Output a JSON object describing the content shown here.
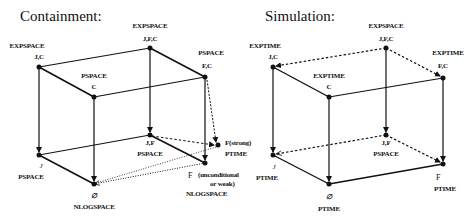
{
  "diagrams": [
    {
      "title": "Containment:",
      "nodes": {
        "jc": {
          "set": "J,C",
          "class": "EXPSPACE"
        },
        "jfc": {
          "set": "J,F,C",
          "class": "EXPSPACE"
        },
        "c": {
          "set": "C",
          "class": "PSPACE"
        },
        "fc": {
          "set": "F,C",
          "class": "PSPACE"
        },
        "j": {
          "set": "J",
          "class": "PSPACE"
        },
        "jf": {
          "set": "J,F",
          "class": "PSPACE"
        },
        "empty": {
          "set": "∅",
          "class": "NLOGSPACE"
        },
        "f": {
          "set": "F",
          "note1": "(unconditional",
          "note2": "or weak)",
          "class": "NLOGSPACE"
        },
        "fstrong": {
          "set": "F(strong)",
          "class": "PTIME"
        }
      }
    },
    {
      "title": "Simulation:",
      "nodes": {
        "jc": {
          "set": "J,C",
          "class": "EXPTIME"
        },
        "jfc": {
          "set": "J,F,C",
          "class": "EXPSPACE"
        },
        "c": {
          "set": "C",
          "class": "EXPTIME"
        },
        "fc": {
          "set": "F,C",
          "class": "EXPTIME"
        },
        "j": {
          "set": "J",
          "class": "PTIME"
        },
        "jf": {
          "set": "J,F",
          "class": "PSPACE"
        },
        "empty": {
          "set": "∅",
          "class": "PTIME"
        },
        "f": {
          "set": "F",
          "class": "PTIME"
        }
      }
    }
  ]
}
